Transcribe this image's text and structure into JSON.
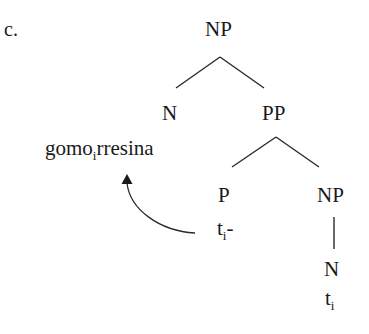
{
  "example_label": "c.",
  "tree": {
    "root": {
      "label": "NP"
    },
    "n_head": {
      "label": "N",
      "word": {
        "text": "gomo",
        "subscript": "i",
        "suffix": "rresina"
      }
    },
    "pp": {
      "label": "PP"
    },
    "p": {
      "label": "P",
      "trace": {
        "text": "t",
        "subscript": "i",
        "suffix": "-"
      }
    },
    "np_inner": {
      "label": "NP"
    },
    "n_inner": {
      "label": "N",
      "trace": {
        "text": "t",
        "subscript": "i"
      }
    }
  },
  "movement_arrow": {
    "from": "p.trace",
    "to": "n_head.word",
    "style": "curved-arrow"
  },
  "colors": {
    "ink": "#1a1a1a",
    "background": "#ffffff"
  }
}
